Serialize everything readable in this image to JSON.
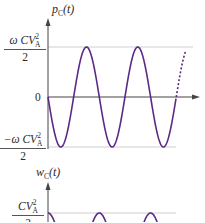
{
  "chart_data": [
    {
      "type": "line",
      "title": "",
      "ylabel": "p_C(t)",
      "ylabel_main": "p",
      "ylabel_sub": "C",
      "ylabel_arg": "(t)",
      "xlabel": "",
      "y_ticks": [
        {
          "label": "ωCV_A²/2",
          "value": 1
        },
        {
          "label": "0",
          "value": 0
        },
        {
          "label": "−ωCV_A²/2",
          "value": -1
        }
      ],
      "ylim": [
        -1,
        1
      ],
      "grid": "horizontal reference lines at ±ωCV_A²/2",
      "series": [
        {
          "name": "p_C(t)",
          "expression": "-sin(2ωt) (normalized)",
          "color": "#5b2a86",
          "style": "solid",
          "periods_shown": 2.5,
          "continuation": "dotted"
        }
      ],
      "x_samples_normalized": [
        0,
        0.25,
        0.5,
        0.75,
        1.0,
        1.25,
        1.5,
        1.75,
        2.0,
        2.25,
        2.5
      ],
      "y_samples": [
        0,
        -1,
        0,
        1,
        0,
        -1,
        0,
        1,
        0,
        -1,
        0
      ]
    },
    {
      "type": "line",
      "title": "",
      "ylabel": "w_C(t)",
      "ylabel_main": "w",
      "ylabel_sub": "C",
      "ylabel_arg": "(t)",
      "xlabel": "",
      "y_ticks": [
        {
          "label": "CV_A²/2",
          "value": 1
        }
      ],
      "series": [
        {
          "name": "w_C(t)",
          "color": "#5b2a86",
          "style": "solid",
          "note": "peaks at CV_A²/2, partially cropped"
        }
      ],
      "peak_positions_normalized": [
        0,
        1,
        2
      ]
    }
  ],
  "top_plot": {
    "ylabel": {
      "main": "p",
      "sub": "C",
      "arg": "(t)"
    },
    "upper_label": {
      "num_prefix": "ω",
      "num_main": "CV",
      "num_sub": "A",
      "num_sup": "2",
      "den": "2"
    },
    "zero_label": "0",
    "lower_label": {
      "num_prefix": "−ω",
      "num_main": "CV",
      "num_sub": "A",
      "num_sup": "2",
      "den": "2"
    }
  },
  "bottom_plot": {
    "ylabel": {
      "main": "w",
      "sub": "C",
      "arg": "(t)"
    },
    "upper_label": {
      "num_main": "CV",
      "num_sub": "A",
      "num_sup": "2",
      "den": "2"
    }
  },
  "colors": {
    "curve": "#5b2a86",
    "axis": "#444444",
    "grid": "#c8c8c8"
  }
}
